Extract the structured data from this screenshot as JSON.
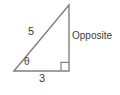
{
  "figure": {
    "type": "right-triangle-diagram",
    "background_color": "#ffffff",
    "stroke_color": "#808080",
    "text_color": "#3c3c3c",
    "labels": {
      "hypotenuse": "5",
      "adjacent": "3",
      "angle": "θ",
      "opposite": "Opposite"
    },
    "geometry": {
      "left_vertex": [
        14,
        71
      ],
      "apex_vertex": [
        69,
        5
      ],
      "right_angle_vertex": [
        69,
        71
      ],
      "right_angle_marker_size": 8,
      "hypotenuse_length_value": 5,
      "adjacent_length_value": 3
    },
    "icons": {
      "right_angle": "right-angle-marker"
    }
  }
}
